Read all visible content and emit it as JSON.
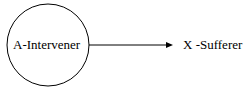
{
  "diagram": {
    "nodes": [
      {
        "id": "A",
        "label": "A-Intervener",
        "shape": "circle"
      },
      {
        "id": "X",
        "label": "X -Sufferer",
        "shape": "text"
      }
    ],
    "edges": [
      {
        "from": "A",
        "to": "X",
        "type": "arrow"
      }
    ],
    "colors": {
      "stroke": "#000000",
      "background": "#ffffff"
    }
  }
}
